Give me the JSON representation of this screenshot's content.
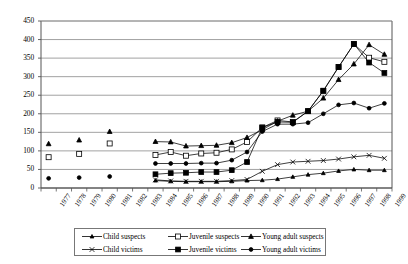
{
  "chart_data": {
    "type": "line",
    "title": "",
    "subtitle": "",
    "xlabel": "",
    "ylabel": "",
    "grid": true,
    "legend_position": "bottom",
    "ylim": [
      0,
      450
    ],
    "yticks": [
      0,
      50,
      100,
      150,
      200,
      250,
      300,
      350,
      400,
      450
    ],
    "categories": [
      "1977",
      "1978",
      "1979",
      "1980",
      "1981",
      "1982",
      "1983",
      "1984",
      "1985",
      "1986",
      "1987",
      "1988",
      "1989",
      "1990",
      "1991",
      "1992",
      "1993",
      "1994",
      "1995",
      "1996",
      "1997",
      "1998",
      "1999"
    ],
    "series": [
      {
        "name": "Child suspects",
        "marker": "triangle-small",
        "color": "#000000",
        "values": [
          null,
          null,
          null,
          null,
          null,
          null,
          null,
          20,
          18,
          17,
          17,
          17,
          18,
          20,
          21,
          24,
          30,
          36,
          40,
          46,
          50,
          48,
          48
        ]
      },
      {
        "name": "Juvenile suspects",
        "marker": "open-square",
        "color": "#000000",
        "values": [
          83,
          null,
          92,
          null,
          120,
          null,
          null,
          89,
          97,
          87,
          93,
          95,
          104,
          124,
          163,
          182,
          178,
          207,
          262,
          326,
          388,
          351,
          340
        ]
      },
      {
        "name": "Young adult suspects",
        "marker": "triangle",
        "color": "#000000",
        "values": [
          119,
          null,
          129,
          null,
          152,
          null,
          null,
          125,
          124,
          113,
          114,
          115,
          122,
          136,
          157,
          180,
          196,
          207,
          242,
          292,
          334,
          386,
          360
        ]
      },
      {
        "name": "Child victims",
        "marker": "cross",
        "color": "#000000",
        "values": [
          null,
          null,
          null,
          null,
          null,
          null,
          null,
          22,
          19,
          18,
          18,
          18,
          20,
          23,
          45,
          63,
          70,
          72,
          74,
          78,
          84,
          88,
          80
        ]
      },
      {
        "name": "Juvenile victims",
        "marker": "filled-square",
        "color": "#000000",
        "values": [
          null,
          null,
          null,
          null,
          null,
          null,
          null,
          37,
          40,
          41,
          43,
          43,
          48,
          70,
          163,
          178,
          177,
          207,
          262,
          326,
          388,
          338,
          310
        ]
      },
      {
        "name": "Young adult victims",
        "marker": "filled-circle",
        "color": "#000000",
        "values": [
          26,
          null,
          28,
          null,
          31,
          null,
          null,
          66,
          66,
          66,
          67,
          67,
          75,
          97,
          152,
          172,
          172,
          176,
          200,
          224,
          229,
          215,
          228
        ]
      }
    ]
  },
  "legend": {
    "items": [
      {
        "label": "Child suspects",
        "marker": "triangle-small"
      },
      {
        "label": "Juvenile suspects",
        "marker": "open-square"
      },
      {
        "label": "Young adult suspects",
        "marker": "triangle"
      },
      {
        "label": "Child victims",
        "marker": "cross"
      },
      {
        "label": "Juvenile victims",
        "marker": "filled-square"
      },
      {
        "label": "Young adult victims",
        "marker": "filled-circle"
      }
    ]
  }
}
